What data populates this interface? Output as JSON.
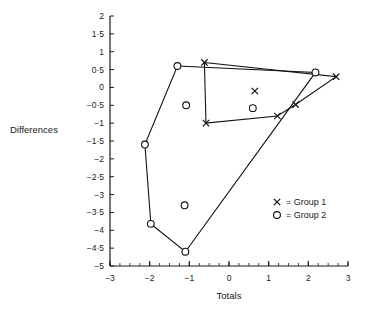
{
  "chart_data": {
    "type": "scatter",
    "title": "",
    "xlabel": "Totals",
    "ylabel": "Differences",
    "xlim": [
      -3,
      3
    ],
    "ylim": [
      -5,
      2
    ],
    "grid": false,
    "xticks": [
      -3,
      -2,
      -1,
      0,
      1,
      2,
      3
    ],
    "xtick_labels": [
      "−3",
      "−2",
      "−1",
      "0",
      "1",
      "2",
      "3"
    ],
    "xminor_step": 0.25,
    "yticks": [
      2,
      1.5,
      1,
      0.5,
      0,
      -0.5,
      -1,
      -1.5,
      -2,
      -2.5,
      -3,
      -3.5,
      -4,
      -4.5,
      -5
    ],
    "ytick_labels": [
      "2",
      "1·5",
      "1",
      "0·5",
      "0",
      "−0·5",
      "−1",
      "−1·5",
      "−2",
      "−2·5",
      "−3",
      "−3·5",
      "−4",
      "−4·5",
      "−5"
    ],
    "legend_position": "lower-right",
    "legend": [
      {
        "marker": "x",
        "separator": "=",
        "name": "Group 1"
      },
      {
        "marker": "o",
        "separator": "=",
        "name": "Group 2"
      }
    ],
    "series": [
      {
        "name": "Group 1",
        "marker": "x",
        "color": "#111111",
        "points": [
          {
            "x": -0.62,
            "y": 0.7
          },
          {
            "x": -0.58,
            "y": -1.0
          },
          {
            "x": 0.65,
            "y": -0.1
          },
          {
            "x": 1.22,
            "y": -0.8
          },
          {
            "x": 1.68,
            "y": -0.48
          },
          {
            "x": 2.7,
            "y": 0.3
          }
        ],
        "hull": [
          {
            "x": -0.62,
            "y": 0.7
          },
          {
            "x": 2.7,
            "y": 0.3
          },
          {
            "x": 1.68,
            "y": -0.48
          },
          {
            "x": 1.22,
            "y": -0.8
          },
          {
            "x": -0.58,
            "y": -1.0
          }
        ]
      },
      {
        "name": "Group 2",
        "marker": "o",
        "color": "#111111",
        "points": [
          {
            "x": -2.12,
            "y": -1.6
          },
          {
            "x": -1.97,
            "y": -3.82
          },
          {
            "x": -1.3,
            "y": 0.6
          },
          {
            "x": -1.12,
            "y": -3.3
          },
          {
            "x": -1.1,
            "y": -4.6
          },
          {
            "x": -1.08,
            "y": -0.5
          },
          {
            "x": 0.6,
            "y": -0.58
          },
          {
            "x": 2.18,
            "y": 0.42
          }
        ],
        "hull": [
          {
            "x": -1.3,
            "y": 0.6
          },
          {
            "x": 2.18,
            "y": 0.42
          },
          {
            "x": -1.1,
            "y": -4.6
          },
          {
            "x": -1.97,
            "y": -3.82
          },
          {
            "x": -2.12,
            "y": -1.6
          }
        ]
      }
    ]
  }
}
